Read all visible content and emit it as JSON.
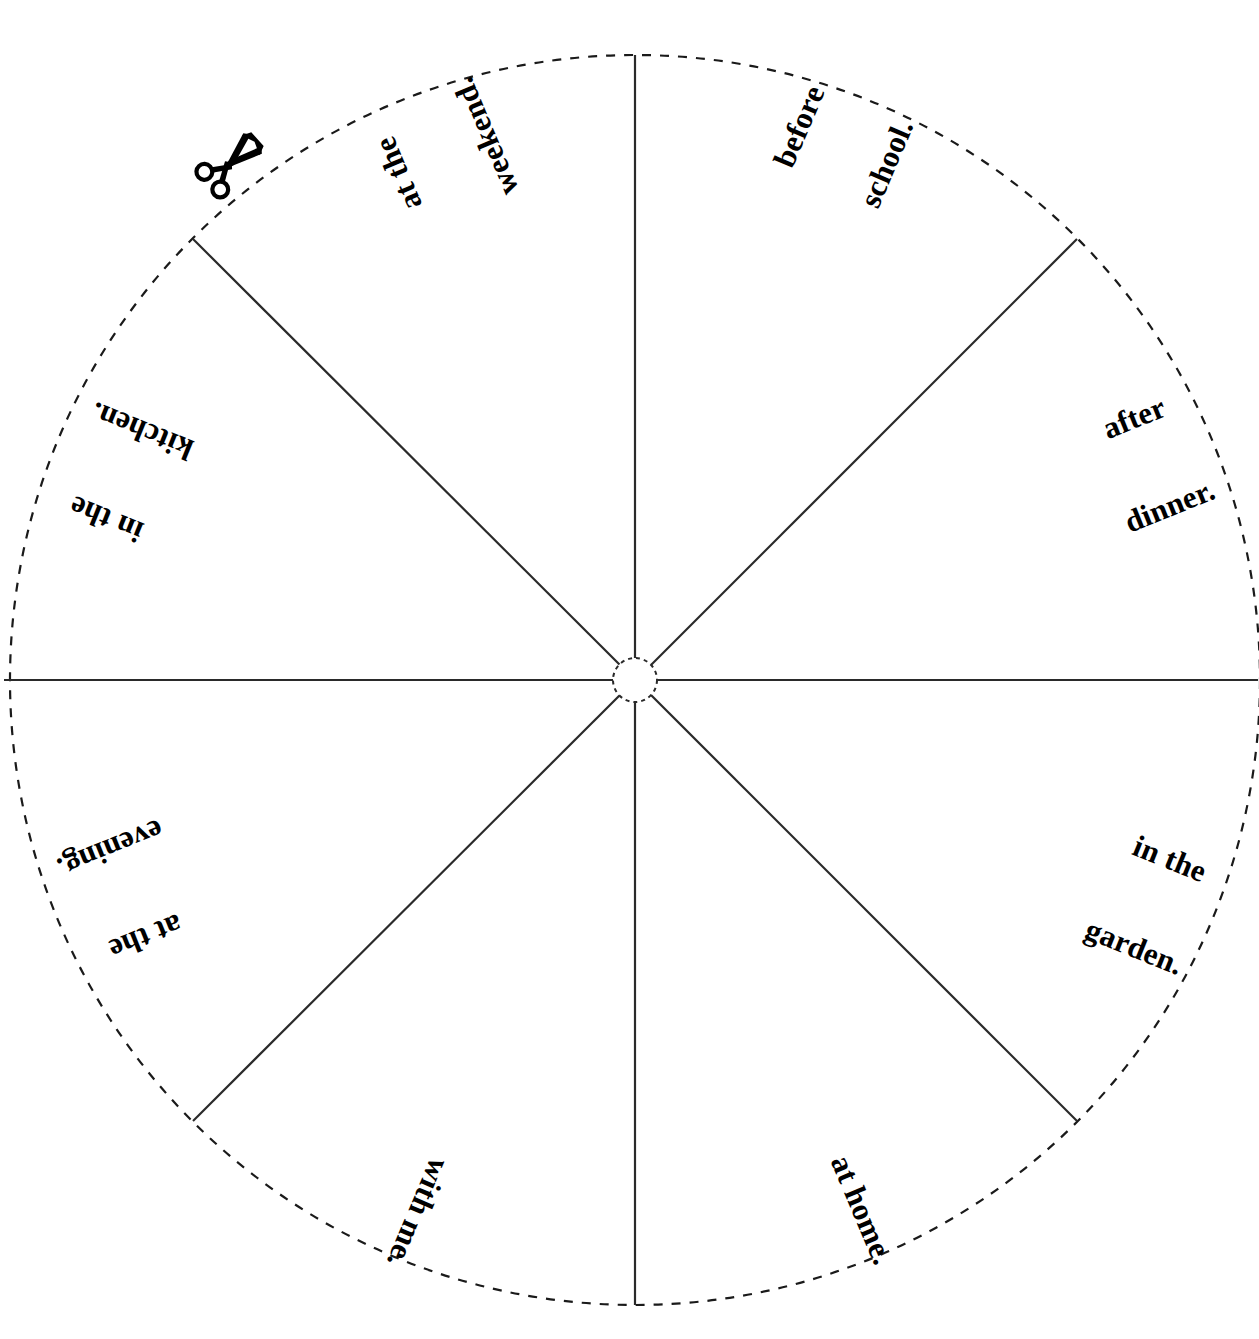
{
  "page": {
    "kind": "spinner-wheel-worksheet",
    "background_color": "#ffffff",
    "ink_color": "#000000",
    "width": 1259,
    "height": 1339
  },
  "wheel": {
    "center_x": 635,
    "center_y": 680,
    "radius": 625,
    "hub_radius": 22,
    "rim_style": "dashed",
    "spoke_style": "solid",
    "sector_count": 8
  },
  "cut_marker": {
    "icon": "scissors-icon",
    "x": 231,
    "y": 163,
    "rotation_deg": -42,
    "meaning": "cut along the dashed line"
  },
  "sectors": [
    {
      "id": "sector-before-school",
      "text": "before school.",
      "lines": [
        "before",
        "school."
      ],
      "x": 843,
      "y": 145,
      "rotation_deg": -67
    },
    {
      "id": "sector-after-dinner",
      "text": "after dinner.",
      "lines": [
        "after",
        "dinner."
      ],
      "x": 1152,
      "y": 462,
      "rotation_deg": -22
    },
    {
      "id": "sector-in-the-garden",
      "text": "in the garden.",
      "lines": [
        "in the",
        "garden."
      ],
      "x": 1152,
      "y": 903,
      "rotation_deg": 22
    },
    {
      "id": "sector-at-home",
      "text": "at home.",
      "lines": [
        "at home."
      ],
      "x": 862,
      "y": 1210,
      "rotation_deg": 67
    },
    {
      "id": "sector-with-me",
      "text": "with me.",
      "lines": [
        "with me."
      ],
      "x": 418,
      "y": 1213,
      "rotation_deg": 113
    },
    {
      "id": "sector-at-the-evening",
      "text": "at the evening.",
      "lines": [
        "at the",
        "evening."
      ],
      "x": 128,
      "y": 893,
      "rotation_deg": 158
    },
    {
      "id": "sector-in-the-kitchen",
      "text": "in the kitchen.",
      "lines": [
        "in the",
        "kitchen."
      ],
      "x": 124,
      "y": 475,
      "rotation_deg": 202
    },
    {
      "id": "sector-at-the-weekend",
      "text": "at the weekend.",
      "lines": [
        "at the",
        "weekend."
      ],
      "x": 442,
      "y": 155,
      "rotation_deg": 247
    }
  ]
}
